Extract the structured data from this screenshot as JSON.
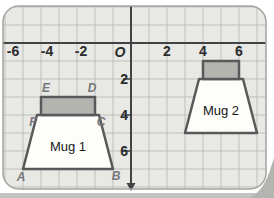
{
  "figure": {
    "origin_label": "O",
    "x_tick_labels": [
      "-6",
      "-4",
      "-2",
      "2",
      "4",
      "6"
    ],
    "y_tick_labels": [
      "2",
      "4",
      "6"
    ],
    "mug1": {
      "label": "Mug 1",
      "vertex_labels": {
        "A": "A",
        "B": "B",
        "C": "C",
        "D": "D",
        "E": "E",
        "F": "F"
      },
      "rim_points": "41,97 95,97 95,115 41,115",
      "body_points": "37,115 99,115 113,169 23,169"
    },
    "mug2": {
      "label": "Mug 2",
      "rim_points": "203,61 239,61 239,79 203,79",
      "body_points": "199,79 243,79 257,133 185,133"
    },
    "colors": {
      "panel_bg": "#e8e8e4",
      "panel_border": "#a3a4a0",
      "grid_line": "#bfc0bc",
      "axis": "#414244",
      "mug_fill": "#fdfdfa",
      "rim_fill": "#b3b4b0",
      "mug_stroke": "#58595b",
      "page_edge": "#c2c3bf",
      "page_corner": "#b4b5b1"
    }
  }
}
